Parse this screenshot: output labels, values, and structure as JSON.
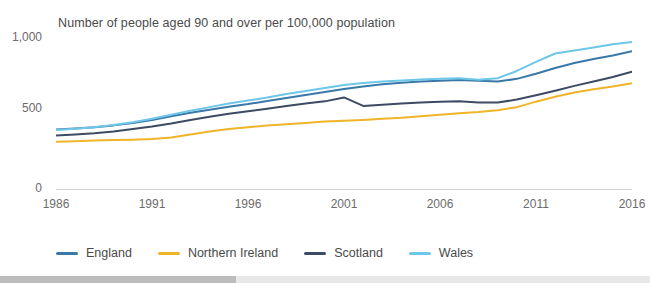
{
  "chart_data": {
    "type": "line",
    "title": "Number of people aged 90 and over per 100,000 population",
    "xlabel": "",
    "ylabel": "",
    "xlim": [
      1986,
      2016
    ],
    "ylim": [
      0,
      1000
    ],
    "y_ticks": [
      0,
      500,
      1000
    ],
    "y_tick_labels": [
      "0",
      "500",
      "1,000"
    ],
    "x_ticks": [
      1986,
      1991,
      1996,
      2001,
      2006,
      2011,
      2016
    ],
    "x_tick_labels": [
      "1986",
      "1991",
      "1996",
      "2001",
      "2006",
      "2011",
      "2016"
    ],
    "grid": false,
    "legend_position": "bottom",
    "x": [
      1986,
      1987,
      1988,
      1989,
      1990,
      1991,
      1992,
      1993,
      1994,
      1995,
      1996,
      1997,
      1998,
      1999,
      2000,
      2001,
      2002,
      2003,
      2004,
      2005,
      2006,
      2007,
      2008,
      2009,
      2010,
      2011,
      2012,
      2013,
      2014,
      2015,
      2016
    ],
    "series": [
      {
        "name": "England",
        "color": "#3a78a8",
        "values": [
          385,
          392,
          400,
          412,
          428,
          448,
          472,
          495,
          515,
          535,
          552,
          572,
          592,
          612,
          632,
          652,
          668,
          682,
          692,
          700,
          706,
          710,
          706,
          700,
          718,
          752,
          790,
          822,
          848,
          872,
          900
        ]
      },
      {
        "name": "Northern Ireland",
        "color": "#f0b429",
        "values": [
          305,
          308,
          312,
          315,
          318,
          322,
          332,
          352,
          372,
          388,
          400,
          412,
          420,
          428,
          438,
          442,
          448,
          455,
          462,
          472,
          482,
          492,
          500,
          512,
          532,
          568,
          600,
          628,
          650,
          668,
          690
        ]
      },
      {
        "name": "Scotland",
        "color": "#3c4a63",
        "values": [
          345,
          352,
          360,
          372,
          388,
          405,
          425,
          448,
          468,
          488,
          505,
          522,
          540,
          556,
          570,
          596,
          540,
          548,
          556,
          562,
          568,
          570,
          562,
          562,
          582,
          610,
          640,
          672,
          700,
          730,
          765
        ]
      },
      {
        "name": "Wales",
        "color": "#6ec6e8",
        "values": [
          382,
          390,
          400,
          415,
          432,
          455,
          482,
          508,
          532,
          556,
          575,
          595,
          618,
          638,
          658,
          678,
          690,
          700,
          708,
          714,
          718,
          722,
          712,
          722,
          770,
          830,
          885,
          905,
          925,
          945,
          960
        ]
      }
    ]
  }
}
